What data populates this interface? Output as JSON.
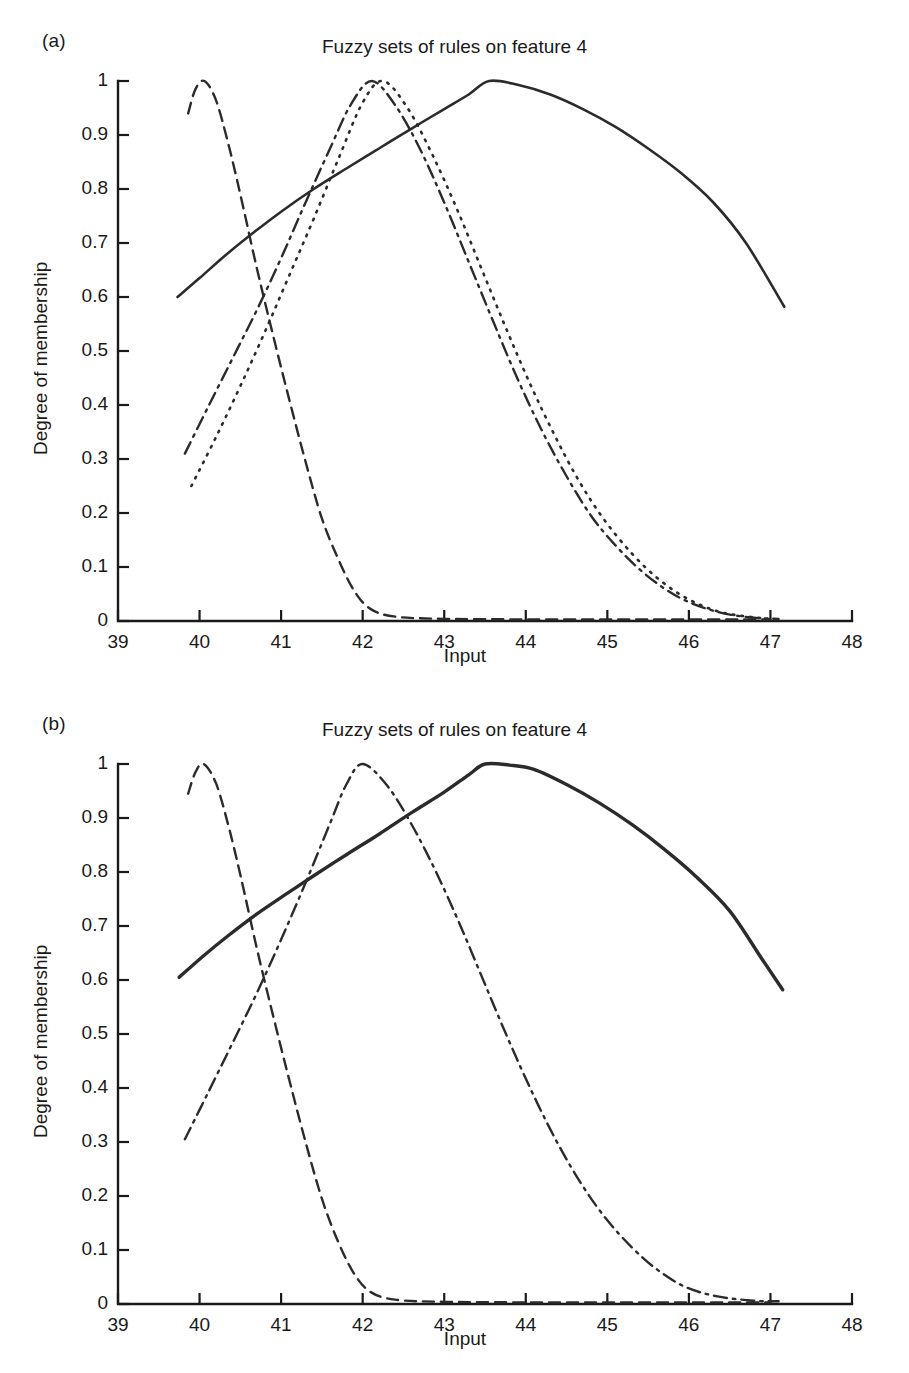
{
  "figure": {
    "panels": [
      {
        "id": "a",
        "panel_label": "(a)",
        "title": "Fuzzy sets of rules on feature 4"
      },
      {
        "id": "b",
        "panel_label": "(b)",
        "title": "Fuzzy sets of rules on feature 4"
      }
    ]
  },
  "axes": {
    "xlabel": "Input",
    "ylabel": "Degree of membership",
    "xticks": [
      "39",
      "40",
      "41",
      "42",
      "43",
      "44",
      "45",
      "46",
      "47",
      "48"
    ],
    "yticks": [
      "0",
      "0.1",
      "0.2",
      "0.3",
      "0.4",
      "0.5",
      "0.6",
      "0.7",
      "0.8",
      "0.9",
      "1"
    ]
  },
  "colors": {
    "curve": "#2b2b2b",
    "axis": "#1a1a1a",
    "background": "#ffffff"
  },
  "chart_data": [
    {
      "type": "line",
      "panel": "a",
      "title": "Fuzzy sets of rules on feature 4",
      "xlabel": "Input",
      "ylabel": "Degree of membership",
      "xlim": [
        39,
        48
      ],
      "ylim": [
        0,
        1
      ],
      "xticks": [
        39,
        40,
        41,
        42,
        43,
        44,
        45,
        46,
        47,
        48
      ],
      "yticks": [
        0,
        0.1,
        0.2,
        0.3,
        0.4,
        0.5,
        0.6,
        0.7,
        0.8,
        0.9,
        1
      ],
      "grid": false,
      "legend": "none",
      "series": [
        {
          "name": "membership-function-1",
          "style": "solid",
          "peak_x": 43.55,
          "peak_y": 1.0,
          "x": [
            39.73,
            40.0,
            40.3,
            40.6,
            41.0,
            41.4,
            41.8,
            42.2,
            42.6,
            43.0,
            43.3,
            43.55,
            43.9,
            44.3,
            44.7,
            45.1,
            45.5,
            45.9,
            46.3,
            46.7,
            47.17
          ],
          "y": [
            0.6,
            0.635,
            0.675,
            0.712,
            0.758,
            0.8,
            0.838,
            0.875,
            0.912,
            0.948,
            0.975,
            1.0,
            0.993,
            0.975,
            0.948,
            0.915,
            0.875,
            0.83,
            0.775,
            0.7,
            0.582
          ]
        },
        {
          "name": "membership-function-2",
          "style": "dashed",
          "peak_x": 40.06,
          "peak_y": 1.0,
          "x": [
            39.86,
            39.95,
            40.06,
            40.2,
            40.35,
            40.5,
            40.7,
            40.9,
            41.1,
            41.3,
            41.5,
            41.7,
            41.9,
            42.1,
            42.4,
            43.0,
            44.0,
            45.0,
            46.0,
            47.0
          ],
          "y": [
            0.94,
            0.985,
            1.0,
            0.965,
            0.885,
            0.79,
            0.655,
            0.53,
            0.41,
            0.295,
            0.19,
            0.115,
            0.055,
            0.022,
            0.008,
            0.004,
            0.003,
            0.003,
            0.003,
            0.003
          ]
        },
        {
          "name": "membership-function-3",
          "style": "dash-dot",
          "peak_x": 42.11,
          "peak_y": 1.0,
          "x": [
            39.82,
            40.1,
            40.4,
            40.7,
            41.0,
            41.3,
            41.6,
            41.85,
            42.11,
            42.4,
            42.7,
            43.0,
            43.3,
            43.6,
            43.9,
            44.2,
            44.5,
            44.8,
            45.1,
            45.4,
            45.7,
            46.0,
            46.4,
            46.8,
            47.1
          ],
          "y": [
            0.31,
            0.395,
            0.485,
            0.575,
            0.672,
            0.775,
            0.875,
            0.955,
            1.0,
            0.955,
            0.875,
            0.775,
            0.665,
            0.555,
            0.448,
            0.352,
            0.268,
            0.195,
            0.14,
            0.095,
            0.06,
            0.035,
            0.015,
            0.006,
            0.004
          ]
        },
        {
          "name": "membership-function-4",
          "style": "dotted",
          "peak_x": 42.25,
          "peak_y": 1.0,
          "x": [
            39.9,
            40.2,
            40.5,
            40.8,
            41.1,
            41.4,
            41.7,
            42.0,
            42.25,
            42.55,
            42.85,
            43.15,
            43.45,
            43.75,
            44.05,
            44.35,
            44.65,
            44.95,
            45.3,
            45.65,
            46.0,
            46.4,
            46.9,
            47.1
          ],
          "y": [
            0.25,
            0.34,
            0.435,
            0.535,
            0.64,
            0.745,
            0.855,
            0.96,
            1.0,
            0.95,
            0.865,
            0.765,
            0.655,
            0.545,
            0.44,
            0.345,
            0.26,
            0.19,
            0.125,
            0.075,
            0.04,
            0.016,
            0.005,
            0.003
          ]
        }
      ]
    },
    {
      "type": "line",
      "panel": "b",
      "title": "Fuzzy sets of rules on feature 4",
      "xlabel": "Input",
      "ylabel": "Degree of membership",
      "xlim": [
        39,
        48
      ],
      "ylim": [
        0,
        1
      ],
      "xticks": [
        39,
        40,
        41,
        42,
        43,
        44,
        45,
        46,
        47,
        48
      ],
      "yticks": [
        0,
        0.1,
        0.2,
        0.3,
        0.4,
        0.5,
        0.6,
        0.7,
        0.8,
        0.9,
        1
      ],
      "grid": false,
      "legend": "none",
      "series": [
        {
          "name": "membership-function-1",
          "style": "solid-bold",
          "peak_x": 43.5,
          "peak_y": 1.0,
          "x": [
            39.75,
            40.05,
            40.35,
            40.7,
            41.05,
            41.4,
            41.8,
            42.2,
            42.6,
            43.0,
            43.3,
            43.5,
            43.8,
            44.1,
            44.5,
            44.9,
            45.3,
            45.7,
            46.1,
            46.5,
            46.9,
            47.15
          ],
          "y": [
            0.605,
            0.645,
            0.682,
            0.722,
            0.758,
            0.793,
            0.832,
            0.87,
            0.91,
            0.948,
            0.98,
            1.0,
            0.998,
            0.99,
            0.962,
            0.928,
            0.888,
            0.842,
            0.79,
            0.728,
            0.638,
            0.582
          ]
        },
        {
          "name": "membership-function-2",
          "style": "dashed",
          "peak_x": 40.05,
          "peak_y": 1.0,
          "x": [
            39.86,
            39.95,
            40.05,
            40.2,
            40.35,
            40.5,
            40.7,
            40.9,
            41.1,
            41.3,
            41.5,
            41.7,
            41.9,
            42.1,
            42.4,
            43.0,
            44.0,
            45.0,
            46.0,
            47.0
          ],
          "y": [
            0.945,
            0.985,
            1.0,
            0.965,
            0.888,
            0.795,
            0.66,
            0.535,
            0.415,
            0.3,
            0.195,
            0.115,
            0.055,
            0.022,
            0.008,
            0.004,
            0.003,
            0.003,
            0.003,
            0.003
          ]
        },
        {
          "name": "membership-function-3",
          "style": "dash-dot",
          "peak_x": 42.0,
          "peak_y": 1.0,
          "x": [
            39.82,
            40.1,
            40.4,
            40.7,
            41.0,
            41.3,
            41.6,
            41.8,
            42.0,
            42.3,
            42.6,
            42.9,
            43.2,
            43.5,
            43.8,
            44.1,
            44.4,
            44.7,
            45.0,
            45.3,
            45.6,
            45.95,
            46.35,
            46.8,
            47.1
          ],
          "y": [
            0.305,
            0.39,
            0.482,
            0.575,
            0.675,
            0.78,
            0.89,
            0.962,
            1.0,
            0.96,
            0.888,
            0.8,
            0.7,
            0.592,
            0.485,
            0.385,
            0.295,
            0.218,
            0.155,
            0.105,
            0.065,
            0.032,
            0.014,
            0.006,
            0.005
          ]
        }
      ]
    }
  ]
}
